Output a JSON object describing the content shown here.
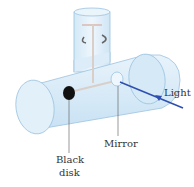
{
  "diagram": {
    "labels": {
      "light": "Light",
      "mirror": "Mirror",
      "black_disk_line1": "Black",
      "black_disk_line2": "disk"
    },
    "colors": {
      "tube_fill": "#dcecf8",
      "tube_stroke": "#9cc3df",
      "arrow": "#2e4fb0",
      "disk": "#111111",
      "rod": "#d9cfc8"
    }
  }
}
